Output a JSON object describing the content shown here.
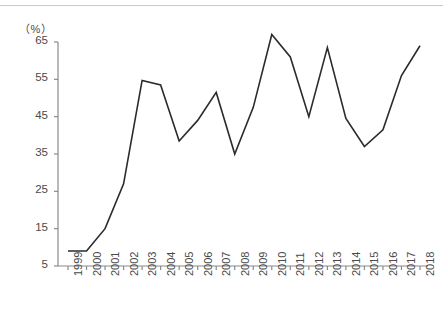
{
  "chart_data": {
    "type": "line",
    "title": "",
    "subtitle": "",
    "xlabel": "",
    "ylabel": "",
    "unit_label": "（%）",
    "categories": [
      "1999",
      "2000",
      "2001",
      "2002",
      "2003",
      "2004",
      "2005",
      "2006",
      "2007",
      "2008",
      "2009",
      "2010",
      "2011",
      "2012",
      "2013",
      "2014",
      "2015",
      "2016",
      "2017",
      "2018"
    ],
    "values": [
      9,
      9,
      15,
      27,
      54.7,
      53.5,
      38.5,
      44,
      51.5,
      35,
      47.5,
      67,
      61,
      45,
      63.5,
      44.5,
      37,
      41.5,
      56,
      64
    ],
    "series": [
      {
        "name": "",
        "values": [
          9,
          9,
          15,
          27,
          54.7,
          53.5,
          38.5,
          44,
          51.5,
          35,
          47.5,
          67,
          61,
          45,
          63.5,
          44.5,
          37,
          41.5,
          56,
          64
        ]
      }
    ],
    "ylim": [
      5,
      68
    ],
    "yticks": [
      5,
      15,
      25,
      35,
      45,
      55,
      65
    ],
    "ytick_labels": [
      "5",
      "15",
      "25",
      "35",
      "45",
      "55",
      "65"
    ],
    "xtick_labels": [
      "1999",
      "2000",
      "2001",
      "2002",
      "2003",
      "2004",
      "2005",
      "2006",
      "2007",
      "2008",
      "2009",
      "2010",
      "2011",
      "2012",
      "2013",
      "2014",
      "2015",
      "2016",
      "2017",
      "2018"
    ],
    "grid": false,
    "legend": null,
    "legend_position": "none",
    "line_color": "#2b2b2b",
    "axis_color": "#8a8a8a",
    "text_color": "#4a4a4a",
    "annotations": []
  }
}
